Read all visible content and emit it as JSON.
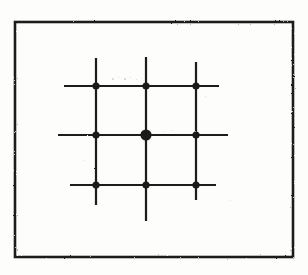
{
  "figure": {
    "title": "Square lattice point grid",
    "media": "scanned halftone line art",
    "background_color": "#fdfdfc",
    "ink_color": "#1a1a1a",
    "frame": {
      "label": "figure border",
      "x": 15,
      "y": 22,
      "width": 278,
      "height": 235,
      "stroke_width": 2.6,
      "color": "#1d1d1d"
    },
    "grid": {
      "rows": 3,
      "columns": 3,
      "spacing_x": 50,
      "spacing_y": 50,
      "line_color": "#1f1f1f",
      "line_width": 2.2,
      "horizontal_lines": [
        {
          "name": "top-horizontal-line",
          "y": 86,
          "x1": 64,
          "x2": 219
        },
        {
          "name": "middle-horizontal-line",
          "y": 135,
          "x1": 58,
          "x2": 228
        },
        {
          "name": "bottom-horizontal-line",
          "y": 185,
          "x1": 70,
          "x2": 216
        }
      ],
      "vertical_lines": [
        {
          "name": "left-vertical-line",
          "x": 96,
          "y1": 58,
          "y2": 205
        },
        {
          "name": "center-vertical-line",
          "x": 146,
          "y1": 57,
          "y2": 221
        },
        {
          "name": "right-vertical-line",
          "x": 196,
          "y1": 62,
          "y2": 200
        }
      ]
    },
    "points": [
      {
        "name": "lattice-point-top-left",
        "row": 1,
        "col": 1,
        "x": 96,
        "y": 86,
        "radius": 3.6,
        "emphasis": "normal"
      },
      {
        "name": "lattice-point-top-center",
        "row": 1,
        "col": 2,
        "x": 146,
        "y": 86,
        "radius": 3.6,
        "emphasis": "normal"
      },
      {
        "name": "lattice-point-top-right",
        "row": 1,
        "col": 3,
        "x": 196,
        "y": 86,
        "radius": 3.6,
        "emphasis": "normal"
      },
      {
        "name": "lattice-point-middle-left",
        "row": 2,
        "col": 1,
        "x": 96,
        "y": 135,
        "radius": 3.6,
        "emphasis": "normal"
      },
      {
        "name": "lattice-point-center",
        "row": 2,
        "col": 2,
        "x": 146,
        "y": 135,
        "radius": 5.6,
        "emphasis": "enlarged"
      },
      {
        "name": "lattice-point-middle-right",
        "row": 2,
        "col": 3,
        "x": 196,
        "y": 135,
        "radius": 3.6,
        "emphasis": "normal"
      },
      {
        "name": "lattice-point-bottom-left",
        "row": 3,
        "col": 1,
        "x": 96,
        "y": 185,
        "radius": 3.6,
        "emphasis": "normal"
      },
      {
        "name": "lattice-point-bottom-center",
        "row": 3,
        "col": 2,
        "x": 146,
        "y": 185,
        "radius": 3.6,
        "emphasis": "normal"
      },
      {
        "name": "lattice-point-bottom-right",
        "row": 3,
        "col": 3,
        "x": 196,
        "y": 185,
        "radius": 3.6,
        "emphasis": "normal"
      }
    ],
    "specks": [
      {
        "x": 112,
        "y": 78,
        "size": 1.6
      },
      {
        "x": 118,
        "y": 77,
        "size": 1.3
      },
      {
        "x": 124,
        "y": 78,
        "size": 1.5
      },
      {
        "x": 130,
        "y": 77,
        "size": 1.2
      },
      {
        "x": 136,
        "y": 79,
        "size": 1.4
      },
      {
        "x": 163,
        "y": 131,
        "size": 1.3
      },
      {
        "x": 171,
        "y": 130,
        "size": 1.1
      },
      {
        "x": 205,
        "y": 96,
        "size": 1.2
      },
      {
        "x": 84,
        "y": 160,
        "size": 1.1
      },
      {
        "x": 230,
        "y": 200,
        "size": 1.2
      }
    ]
  }
}
